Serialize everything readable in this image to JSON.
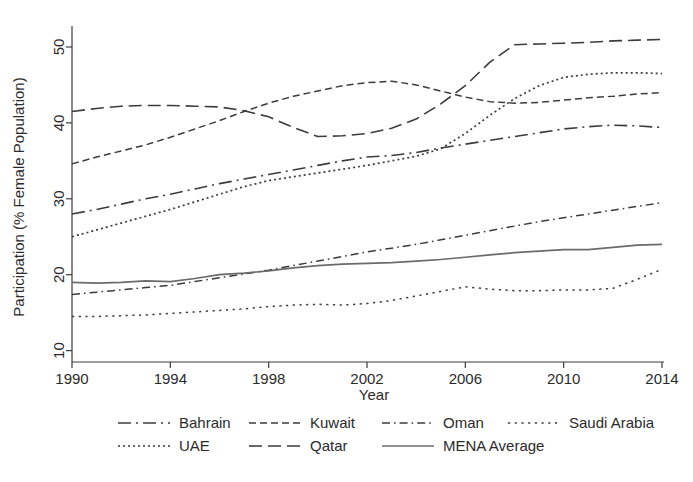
{
  "chart_data": {
    "type": "line",
    "title": "",
    "xlabel": "Year",
    "ylabel": "Participation (% Female Population)",
    "xlim": [
      1990,
      2014
    ],
    "ylim": [
      8.5,
      52.5
    ],
    "xticks": [
      1990,
      1994,
      1998,
      2002,
      2006,
      2010,
      2014
    ],
    "yticks": [
      10,
      20,
      30,
      40,
      50
    ],
    "grid": false,
    "legend_position": "below",
    "x": [
      1990,
      1991,
      1992,
      1993,
      1994,
      1995,
      1996,
      1997,
      1998,
      1999,
      2000,
      2001,
      2002,
      2003,
      2004,
      2005,
      2006,
      2007,
      2008,
      2009,
      2010,
      2011,
      2012,
      2013,
      2014
    ],
    "series": [
      {
        "name": "Bahrain",
        "dash": "long-dash-dot",
        "values": [
          28.0,
          28.6,
          29.3,
          30.0,
          30.6,
          31.3,
          32.0,
          32.6,
          33.2,
          33.8,
          34.4,
          35.0,
          35.5,
          35.7,
          36.1,
          36.7,
          37.2,
          37.7,
          38.2,
          38.7,
          39.2,
          39.5,
          39.7,
          39.6,
          39.4
        ]
      },
      {
        "name": "Kuwait",
        "dash": "dash",
        "values": [
          34.6,
          35.5,
          36.3,
          37.1,
          38.1,
          39.2,
          40.3,
          41.5,
          42.6,
          43.5,
          44.2,
          44.9,
          45.3,
          45.5,
          45.0,
          44.2,
          43.4,
          42.8,
          42.6,
          42.7,
          43.0,
          43.3,
          43.5,
          43.8,
          44.0
        ]
      },
      {
        "name": "Oman",
        "dash": "dash-dot",
        "values": [
          17.4,
          17.7,
          18.0,
          18.3,
          18.6,
          19.1,
          19.6,
          20.1,
          20.6,
          21.2,
          21.8,
          22.4,
          23.0,
          23.5,
          24.0,
          24.6,
          25.2,
          25.8,
          26.4,
          27.0,
          27.5,
          28.0,
          28.5,
          29.0,
          29.5
        ]
      },
      {
        "name": "Saudi Arabia",
        "dash": "dot-sparse",
        "values": [
          14.5,
          14.5,
          14.6,
          14.7,
          14.9,
          15.1,
          15.3,
          15.5,
          15.8,
          16.0,
          16.1,
          16.0,
          16.2,
          16.6,
          17.2,
          17.8,
          18.4,
          18.1,
          17.9,
          17.9,
          18.0,
          18.0,
          18.2,
          19.4,
          20.7
        ]
      },
      {
        "name": "UAE",
        "dash": "dot",
        "values": [
          25.0,
          25.9,
          26.8,
          27.7,
          28.6,
          29.6,
          30.6,
          31.6,
          32.4,
          32.9,
          33.4,
          33.9,
          34.4,
          35.0,
          35.6,
          36.6,
          38.6,
          41.0,
          43.2,
          44.9,
          46.0,
          46.4,
          46.6,
          46.6,
          46.5
        ]
      },
      {
        "name": "Qatar",
        "dash": "long-dash",
        "values": [
          41.5,
          41.9,
          42.2,
          42.3,
          42.3,
          42.2,
          42.1,
          41.6,
          40.8,
          39.4,
          38.2,
          38.3,
          38.6,
          39.3,
          40.5,
          42.5,
          44.9,
          48.0,
          50.3,
          50.4,
          50.5,
          50.6,
          50.8,
          50.9,
          51.0
        ]
      },
      {
        "name": "MENA Average",
        "dash": "solid",
        "values": [
          19.0,
          18.9,
          19.0,
          19.2,
          19.1,
          19.5,
          20.0,
          20.2,
          20.5,
          20.9,
          21.2,
          21.4,
          21.5,
          21.6,
          21.8,
          22.0,
          22.3,
          22.6,
          22.9,
          23.1,
          23.3,
          23.3,
          23.6,
          23.9,
          24.0
        ]
      }
    ]
  },
  "axes": {
    "y_title": "Participation (% Female Population)",
    "x_title": "Year",
    "y_tick_labels": [
      "10",
      "20",
      "30",
      "40",
      "50"
    ],
    "x_tick_labels": [
      "1990",
      "1994",
      "1998",
      "2002",
      "2006",
      "2010",
      "2014"
    ]
  },
  "legend": {
    "row1": [
      {
        "label": "Bahrain",
        "dash": "long-dash-dot"
      },
      {
        "label": "Kuwait",
        "dash": "dash"
      },
      {
        "label": "Oman",
        "dash": "dash-dot"
      },
      {
        "label": "Saudi Arabia",
        "dash": "dot-sparse"
      }
    ],
    "row2": [
      {
        "label": "UAE",
        "dash": "dot"
      },
      {
        "label": "Qatar",
        "dash": "long-dash"
      },
      {
        "label": "MENA Average",
        "dash": "solid"
      }
    ]
  },
  "style": {
    "line_color": "#3c3c3c",
    "mena_color": "#6b6b6b",
    "background": "#ffffff"
  }
}
